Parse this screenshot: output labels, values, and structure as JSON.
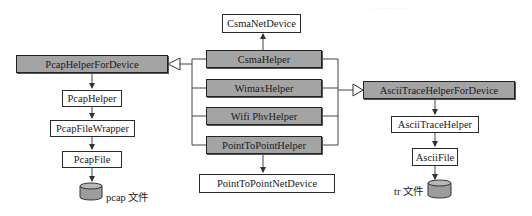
{
  "diagram": {
    "type": "class-relationship",
    "header_faint_text": "…………",
    "colors": {
      "shaded_fill": "#a4a4a4",
      "plain_fill": "#ffffff",
      "line": "#444444",
      "border": "#222222"
    },
    "nodes": {
      "csma_net_device": "CsmaNetDevice",
      "csma_helper": "CsmaHelper",
      "wimax_helper": "WimaxHelper",
      "wifi_phy_helper": "Wifi PhvHelper",
      "point_to_point_helper": "PointToPointHelper",
      "point_to_point_net_device": "PointToPointNetDevice",
      "pcap_helper_for_device": "PcapHelperForDevice",
      "pcap_helper": "PcapHelper",
      "pcap_file_wrapper": "PcapFileWrapper",
      "pcap_file": "PcapFile",
      "ascii_trace_helper_for_device": "AsciiTraceHelperForDevice",
      "ascii_trace_helper": "AsciiTraceHelper",
      "ascii_file": "AsciiFile"
    },
    "storage": {
      "pcap": {
        "label": "pcap 文件",
        "icon": "database-cylinder-icon"
      },
      "tr": {
        "label": "tr 文件",
        "icon": "database-cylinder-icon"
      }
    },
    "edges": [
      {
        "from": "CsmaHelper",
        "to": "CsmaNetDevice",
        "kind": "arrow"
      },
      {
        "from": "PointToPointHelper",
        "to": "PointToPointNetDevice",
        "kind": "arrow"
      },
      {
        "from": "CsmaHelper|WimaxHelper|Wifi PhvHelper|PointToPointHelper",
        "to": "PcapHelperForDevice",
        "kind": "inheritance"
      },
      {
        "from": "CsmaHelper|WimaxHelper|Wifi PhvHelper|PointToPointHelper",
        "to": "AsciiTraceHelperForDevice",
        "kind": "inheritance"
      },
      {
        "from": "PcapHelperForDevice",
        "to": "PcapHelper",
        "kind": "arrow"
      },
      {
        "from": "PcapHelper",
        "to": "PcapFileWrapper",
        "kind": "arrow"
      },
      {
        "from": "PcapFileWrapper",
        "to": "PcapFile",
        "kind": "arrow"
      },
      {
        "from": "PcapFile",
        "to": "pcap 文件",
        "kind": "arrow"
      },
      {
        "from": "AsciiTraceHelperForDevice",
        "to": "AsciiTraceHelper",
        "kind": "arrow"
      },
      {
        "from": "AsciiTraceHelper",
        "to": "AsciiFile",
        "kind": "arrow"
      },
      {
        "from": "AsciiFile",
        "to": "tr 文件",
        "kind": "arrow"
      }
    ]
  }
}
